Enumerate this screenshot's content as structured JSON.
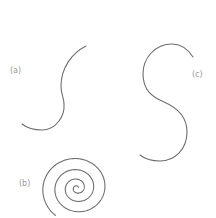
{
  "figure": {
    "background": "#ffffff",
    "stroke_color": "#6e6e6e",
    "label_color": "#9a9a9a",
    "panels": [
      {
        "id": "a",
        "label": "(a)",
        "shape": "s-curve"
      },
      {
        "id": "b",
        "label": "(b)",
        "shape": "spiral"
      },
      {
        "id": "c",
        "label": "(c)",
        "shape": "s-curve"
      }
    ]
  }
}
